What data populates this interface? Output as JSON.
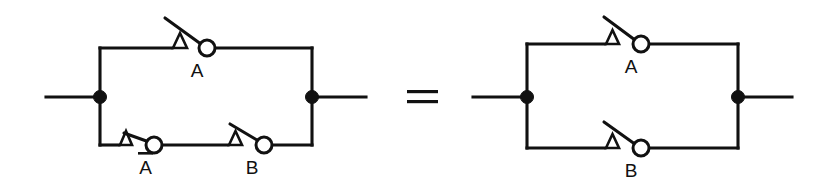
{
  "diagram": {
    "relation_symbol": "=",
    "colors": {
      "background": "#ffffff",
      "line": "#111111",
      "contact_fill": "#ffffff"
    },
    "left_circuit": {
      "name": "parallel-network-A-plus-notA-and-B",
      "top_branch": {
        "switches": [
          {
            "label": "A",
            "state": "open",
            "has_overbar": false
          }
        ]
      },
      "bottom_branch": {
        "switches": [
          {
            "label": "A",
            "state": "open",
            "has_overbar": true
          },
          {
            "label": "B",
            "state": "open",
            "has_overbar": false
          }
        ]
      },
      "terminals": [
        "left",
        "right"
      ],
      "node_count": 2
    },
    "right_circuit": {
      "name": "parallel-network-A-plus-B",
      "top_branch": {
        "switches": [
          {
            "label": "A",
            "state": "open",
            "has_overbar": false
          }
        ]
      },
      "bottom_branch": {
        "switches": [
          {
            "label": "B",
            "state": "open",
            "has_overbar": false
          }
        ]
      },
      "terminals": [
        "left",
        "right"
      ],
      "node_count": 2
    },
    "labels": {
      "left_top_switch": "A",
      "left_bottom_switch_1": "A",
      "left_bottom_switch_2": "B",
      "right_top_switch": "A",
      "right_bottom_switch": "B"
    }
  }
}
